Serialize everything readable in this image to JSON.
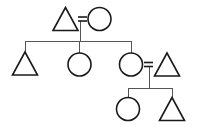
{
  "figure": {
    "kind": "pedigree-chart",
    "title": "Pedigree chart",
    "background_color": "#ffffff",
    "line_color": "#555555",
    "symbol_stroke_color": "#1a1a1a",
    "symbol_fill": "none",
    "symbol_stroke_width": 1.6,
    "line_stroke_width": 1,
    "width": 197,
    "height": 133
  },
  "legend": {
    "triangle_meaning": "triangle",
    "circle_meaning": "circle",
    "equals_meaning": "union"
  },
  "generations": [
    {
      "id": "generation-1",
      "label": "Generation I",
      "members": [
        {
          "id": "g1-triangle",
          "shape": "triangle",
          "cx": 65.5,
          "cy": 19,
          "size": 25,
          "label": "G1 triangle"
        },
        {
          "id": "g1-circle",
          "shape": "circle",
          "cx": 99.5,
          "cy": 19,
          "r": 11.5,
          "label": "G1 circle"
        }
      ]
    },
    {
      "id": "generation-2",
      "label": "Generation II",
      "members": [
        {
          "id": "g2-triangle-left",
          "shape": "triangle",
          "cx": 25,
          "cy": 63.5,
          "size": 25,
          "label": "G2 triangle left"
        },
        {
          "id": "g2-circle-middle",
          "shape": "circle",
          "cx": 79.5,
          "cy": 64.5,
          "r": 11.5,
          "label": "G2 circle middle"
        },
        {
          "id": "g2-circle-right",
          "shape": "circle",
          "cx": 131,
          "cy": 64.5,
          "r": 11.5,
          "label": "G2 circle right"
        },
        {
          "id": "g2-triangle-right",
          "shape": "triangle",
          "cx": 167,
          "cy": 64.5,
          "size": 25,
          "label": "G2 triangle right"
        }
      ]
    },
    {
      "id": "generation-3",
      "label": "Generation III",
      "members": [
        {
          "id": "g3-circle",
          "shape": "circle",
          "cx": 128,
          "cy": 109,
          "r": 11.5,
          "label": "G3 circle"
        },
        {
          "id": "g3-triangle",
          "shape": "triangle",
          "cx": 172,
          "cy": 109,
          "size": 25,
          "label": "G3 triangle"
        }
      ]
    }
  ],
  "unions": [
    {
      "id": "union-1",
      "label": "Union between G1 triangle and G1 circle",
      "equals_x": 82.5,
      "equals_y": 19,
      "equals_width": 9,
      "equals_gap": 4.0,
      "descent_x": 80,
      "descent_from_y": 21,
      "descent_to_y": 41
    },
    {
      "id": "union-2",
      "label": "Union between G2 circle right and G2 triangle right",
      "equals_x": 148.5,
      "equals_y": 64.5,
      "equals_width": 9,
      "equals_gap": 4.0,
      "descent_x": 149,
      "descent_from_y": 67,
      "descent_to_y": 88
    }
  ],
  "sibship_lines": [
    {
      "id": "sibship-1",
      "label": "Sibship line generation II",
      "y": 41,
      "x_start": 25,
      "x_end": 131,
      "drops": [
        {
          "id": "drop-g2-triangle-left",
          "x": 25,
          "to_y": 52
        },
        {
          "id": "drop-g2-circle-middle",
          "x": 79.5,
          "to_y": 53
        },
        {
          "id": "drop-g2-circle-right",
          "x": 131,
          "to_y": 53
        }
      ]
    },
    {
      "id": "sibship-2",
      "label": "Sibship line generation III",
      "y": 88,
      "x_start": 128,
      "x_end": 172,
      "drops": [
        {
          "id": "drop-g3-circle",
          "x": 128,
          "to_y": 97.5
        },
        {
          "id": "drop-g3-triangle",
          "x": 172,
          "to_y": 97
        }
      ]
    }
  ]
}
